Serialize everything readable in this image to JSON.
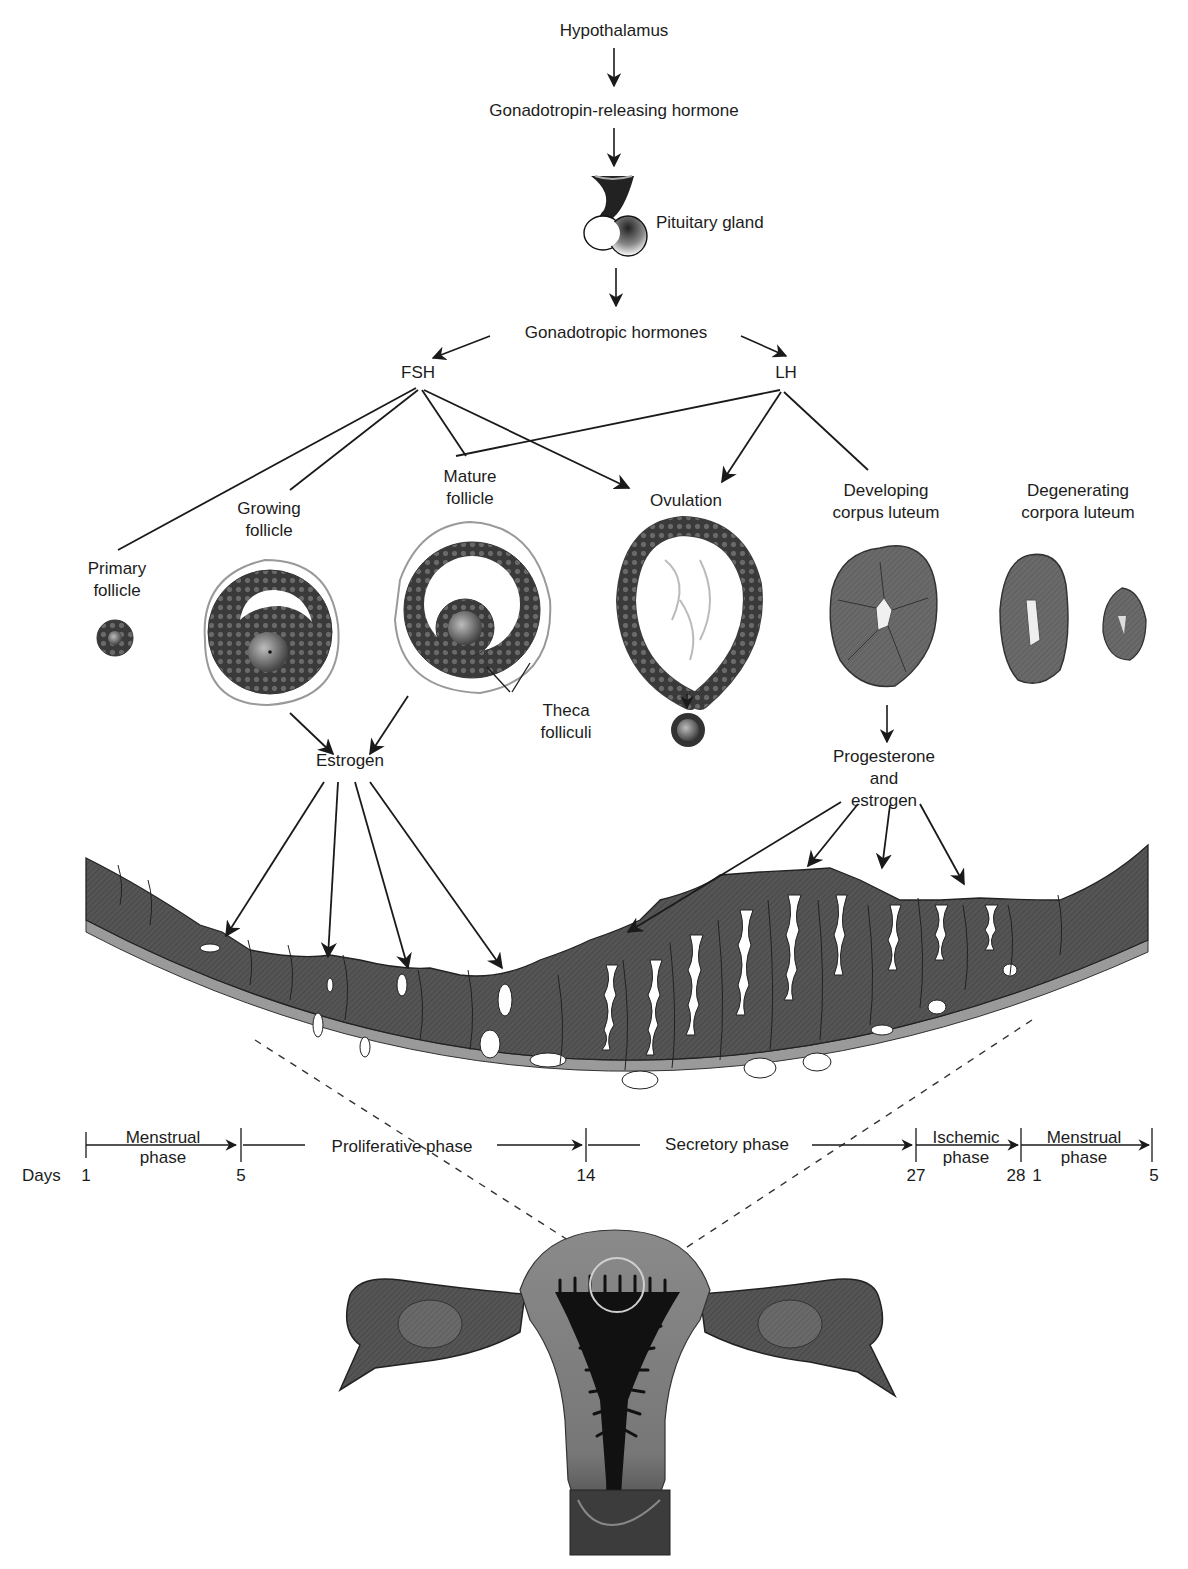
{
  "diagram": {
    "colors": {
      "ink": "#1a1a1a",
      "tissue_dark": "#4a4a4a",
      "tissue_mid": "#6e6e6e",
      "tissue_light": "#9a9a9a",
      "background": "#ffffff"
    },
    "axis": {
      "nodes": {
        "hypothalamus": "Hypothalamus",
        "gnrh": "Gonadotropin-releasing hormone",
        "pituitary": "Pituitary gland",
        "gonadotropic": "Gonadotropic hormones",
        "fsh": "FSH",
        "lh": "LH"
      }
    },
    "ovarian_stages": {
      "primary": [
        "Primary",
        "follicle"
      ],
      "growing": [
        "Growing",
        "follicle"
      ],
      "mature": [
        "Mature",
        "follicle"
      ],
      "ovulation": [
        "Ovulation"
      ],
      "developing_cl": [
        "Developing",
        "corpus luteum"
      ],
      "degenerating_cl": [
        "Degenerating",
        "corpora luteum"
      ],
      "theca": [
        "Theca",
        "folliculi"
      ]
    },
    "hormones": {
      "estrogen": "Estrogen",
      "prog_estrogen": [
        "Progesterone",
        "and",
        "estrogen"
      ]
    },
    "edges": [
      {
        "from": "Hypothalamus",
        "to": "Gonadotropin-releasing hormone"
      },
      {
        "from": "Gonadotropin-releasing hormone",
        "to": "Pituitary gland"
      },
      {
        "from": "Pituitary gland",
        "to": "Gonadotropic hormones"
      },
      {
        "from": "Gonadotropic hormones",
        "to": "FSH"
      },
      {
        "from": "Gonadotropic hormones",
        "to": "LH"
      },
      {
        "from": "FSH",
        "to": "Primary follicle"
      },
      {
        "from": "FSH",
        "to": "Growing follicle"
      },
      {
        "from": "FSH",
        "to": "Mature follicle"
      },
      {
        "from": "FSH",
        "to": "Ovulation"
      },
      {
        "from": "LH",
        "to": "Mature follicle"
      },
      {
        "from": "LH",
        "to": "Ovulation"
      },
      {
        "from": "LH",
        "to": "Developing corpus luteum"
      },
      {
        "from": "Growing follicle",
        "to": "Estrogen"
      },
      {
        "from": "Mature follicle",
        "to": "Estrogen"
      },
      {
        "from": "Developing corpus luteum",
        "to": "Progesterone and estrogen"
      },
      {
        "from": "Estrogen",
        "to": "Endometrium (proliferative)"
      },
      {
        "from": "Progesterone and estrogen",
        "to": "Endometrium (secretory)"
      }
    ],
    "timeline": {
      "days_label": "Days",
      "phases": [
        {
          "name": [
            "Menstrual",
            "phase"
          ],
          "start": "1",
          "end": "5"
        },
        {
          "name": [
            "Proliferative phase"
          ],
          "start": "5",
          "end": "14"
        },
        {
          "name": [
            "Secretory phase"
          ],
          "start": "14",
          "end": "27"
        },
        {
          "name": [
            "Ischemic",
            "phase"
          ],
          "start": "27",
          "end": "28"
        },
        {
          "name": [
            "Menstrual",
            "phase"
          ],
          "start": "1",
          "end": "5"
        }
      ],
      "ticks": [
        "1",
        "5",
        "14",
        "27",
        "28",
        "1",
        "5"
      ]
    }
  }
}
